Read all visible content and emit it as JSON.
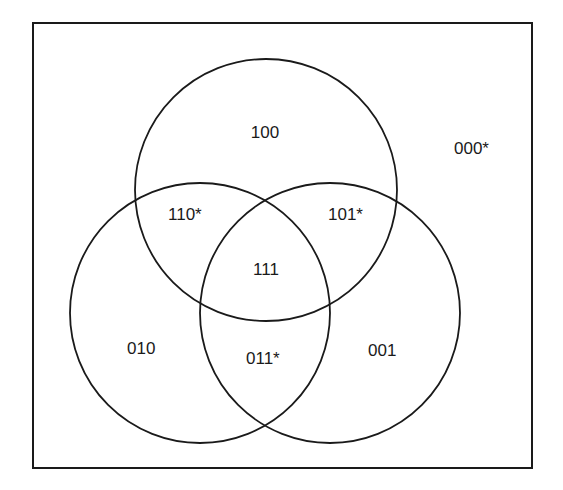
{
  "diagram": {
    "type": "venn",
    "stroke_color": "#1a1a1a",
    "regions": {
      "r000": "000*",
      "r100": "100",
      "r110": "110*",
      "r101": "101*",
      "r111": "111",
      "r010": "010",
      "r011": "011*",
      "r001": "001"
    }
  }
}
